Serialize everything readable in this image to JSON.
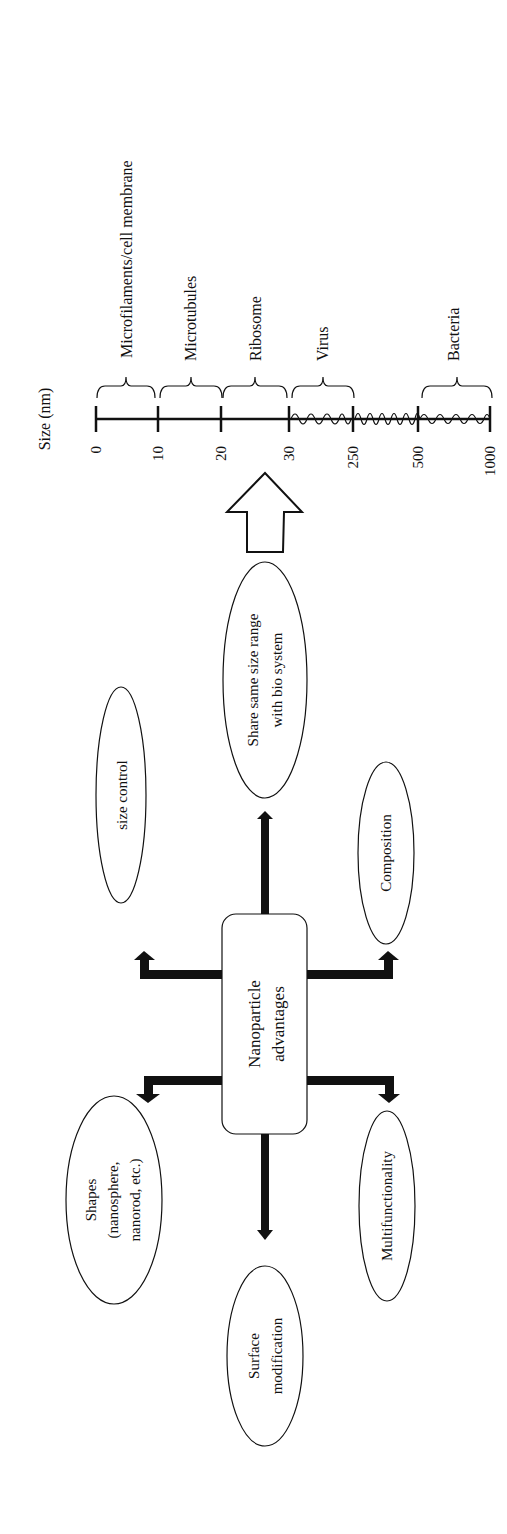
{
  "scale": {
    "title": "Size (nm)",
    "ticks": [
      "0",
      "10",
      "20",
      "30",
      "250",
      "500",
      "1000"
    ],
    "ranges": [
      {
        "label": "Microfilaments/cell membrane",
        "from": "0",
        "to": "10"
      },
      {
        "label": "Microtubules",
        "from": "10",
        "to": "20"
      },
      {
        "label": "Ribosome",
        "from": "20",
        "to": "30"
      },
      {
        "label": "Virus",
        "from": "30",
        "to": "250"
      },
      {
        "label": "Bacteria",
        "from": "500",
        "to": "1000"
      }
    ]
  },
  "center": {
    "line1": "Nanoparticle",
    "line2": "advantages"
  },
  "nodes": {
    "share": {
      "line1": "Share same size range",
      "line2": "with bio system"
    },
    "size_control": {
      "line1": "size control"
    },
    "composition": {
      "line1": "Composition"
    },
    "shapes": {
      "line1": "Shapes",
      "line2": "(nanosphere,",
      "line3": "nanorod, etc.)"
    },
    "multifunctionality": {
      "line1": "Multifunctionality"
    },
    "surface": {
      "line1": "Surface",
      "line2": "modification"
    }
  },
  "colors": {
    "ink": "#111111",
    "background": "#ffffff"
  }
}
